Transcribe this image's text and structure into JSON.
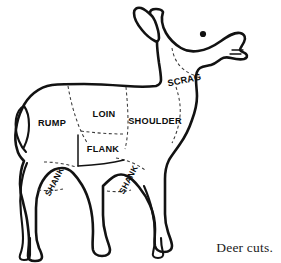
{
  "figure": {
    "title": "Deer cuts.",
    "caption": "Deer cuts.",
    "background_color": "#ffffff",
    "outline_color": "#121212",
    "cutline_color": "#3a3a3a",
    "label_color": "#0d0d0d"
  },
  "cuts": [
    {
      "id": "rump",
      "label": "RUMP",
      "x": 52,
      "y": 126,
      "rotation": 0
    },
    {
      "id": "loin",
      "label": "LOIN",
      "x": 104,
      "y": 117,
      "rotation": 0
    },
    {
      "id": "shoulder",
      "label": "SHOULDER",
      "x": 155,
      "y": 124,
      "rotation": 0
    },
    {
      "id": "flank",
      "label": "FLANK",
      "x": 103,
      "y": 152,
      "rotation": 0
    },
    {
      "id": "scrag",
      "label": "SCRAG",
      "x": 185,
      "y": 83,
      "rotation": -12
    },
    {
      "id": "shank-rear",
      "label": "SHANK",
      "x": 57,
      "y": 183,
      "rotation": -62
    },
    {
      "id": "shank-fore",
      "label": "SHANK",
      "x": 131,
      "y": 181,
      "rotation": -62
    }
  ],
  "anatomy": {
    "parts": [
      "ear",
      "eye",
      "muzzle",
      "neck",
      "body",
      "tail",
      "foreleg",
      "hindleg",
      "hoof"
    ]
  }
}
